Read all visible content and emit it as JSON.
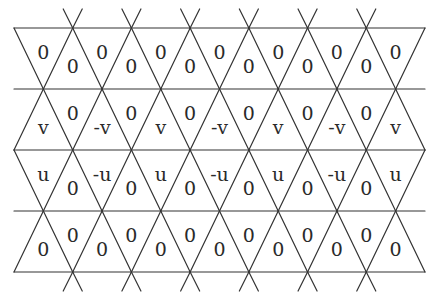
{
  "diagram": {
    "title": "",
    "grid": {
      "left_x": 14,
      "right_x": 425,
      "step": 58.7,
      "horizontal_lines_y": [
        28,
        89,
        150,
        211,
        272
      ],
      "stub_length": 19,
      "line_color": "#333333"
    },
    "rows": [
      {
        "name": "row-1",
        "labels": [
          "0",
          "0",
          "0",
          "0",
          "0",
          "0",
          "0",
          "0",
          "0",
          "0",
          "0",
          "0",
          "0"
        ]
      },
      {
        "name": "row-2",
        "labels": [
          "v",
          "0",
          "-v",
          "0",
          "v",
          "0",
          "-v",
          "0",
          "v",
          "0",
          "-v",
          "0",
          "v"
        ]
      },
      {
        "name": "row-3",
        "labels": [
          "u",
          "0",
          "-u",
          "0",
          "u",
          "0",
          "-u",
          "0",
          "u",
          "0",
          "-u",
          "0",
          "u"
        ]
      },
      {
        "name": "row-4",
        "labels": [
          "0",
          "0",
          "0",
          "0",
          "0",
          "0",
          "0",
          "0",
          "0",
          "0",
          "0",
          "0",
          "0"
        ]
      }
    ]
  }
}
